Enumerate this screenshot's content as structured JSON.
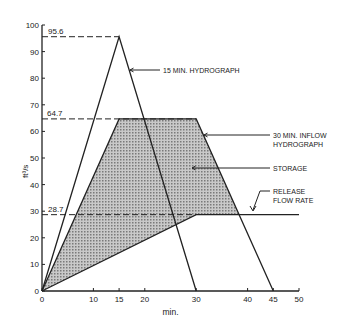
{
  "chart_data": {
    "type": "line",
    "title": "",
    "xlabel": "min.",
    "ylabel": "ft³/s",
    "xlim": [
      0,
      50
    ],
    "ylim": [
      0,
      100
    ],
    "x_ticks": [
      0,
      10,
      15,
      20,
      30,
      40,
      45,
      50
    ],
    "y_ticks": [
      0,
      10,
      20,
      30,
      40,
      50,
      60,
      70,
      80,
      90,
      100
    ],
    "grid": false,
    "series": [
      {
        "name": "15 MIN. HYDROGRAPH",
        "x": [
          0,
          15,
          30
        ],
        "y": [
          0,
          95.6,
          0
        ]
      },
      {
        "name": "30 MIN. INFLOW HYDROGRAPH",
        "x": [
          0,
          15,
          30,
          45
        ],
        "y": [
          0,
          64.7,
          64.7,
          0
        ]
      },
      {
        "name": "RELEASE FLOW RATE",
        "x": [
          0,
          30,
          50
        ],
        "y": [
          0,
          28.7,
          28.7
        ]
      }
    ],
    "shaded_region": {
      "name": "STORAGE",
      "between": [
        "30 MIN. INFLOW HYDROGRAPH",
        "RELEASE FLOW RATE"
      ]
    },
    "reference_values": [
      {
        "label": "95.6",
        "y": 95.6
      },
      {
        "label": "64.7",
        "y": 64.7
      },
      {
        "label": "28.7",
        "y": 28.7
      }
    ],
    "annotations": [
      {
        "text": "15 MIN. HYDROGRAPH"
      },
      {
        "text": "30 MIN. INFLOW HYDROGRAPH"
      },
      {
        "text": "STORAGE"
      },
      {
        "text": "RELEASE FLOW RATE"
      }
    ]
  },
  "labels": {
    "ylabel": "ft³/s",
    "xlabel": "min.",
    "ref_956": "95.6",
    "ref_647": "64.7",
    "ref_287": "28.7",
    "ann_15min": "15 MIN. HYDROGRAPH",
    "ann_30min_1": "30 MIN. INFLOW",
    "ann_30min_2": "HYDROGRAPH",
    "ann_storage": "STORAGE",
    "ann_release_1": "RELEASE",
    "ann_release_2": "FLOW RATE"
  }
}
